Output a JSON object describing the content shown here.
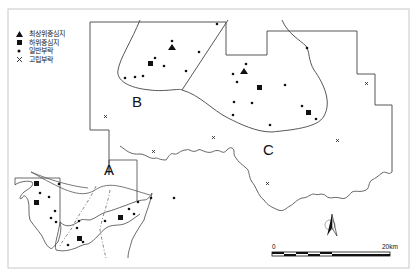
{
  "legend": {
    "items": [
      {
        "symbol": "triangle",
        "label": "최상위중심지"
      },
      {
        "symbol": "square",
        "label": "하위중심지"
      },
      {
        "symbol": "dot",
        "label": "일반부락"
      },
      {
        "symbol": "cross",
        "label": "고립부락"
      }
    ]
  },
  "regions": {
    "A": "A",
    "B": "B",
    "C": "C"
  },
  "scale_bar": {
    "start_label": "0",
    "end_label": "20km"
  },
  "north_arrow": "north-arrow",
  "colors": {
    "line": "#333333",
    "frame": "#c8c8c8",
    "symbol": "#111111"
  }
}
